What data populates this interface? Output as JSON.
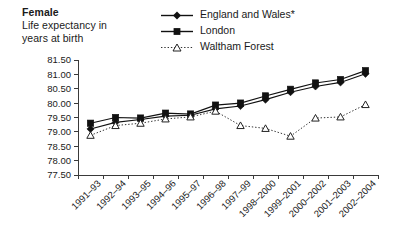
{
  "header": {
    "title": "Female",
    "subtitle_line1": "Life expectancy in",
    "subtitle_line2": "years at birth"
  },
  "legend": {
    "position": "top-right",
    "items": [
      {
        "label": "England and Wales*",
        "marker": "filled-diamond-icon",
        "line": "solid",
        "color": "#111111"
      },
      {
        "label": "London",
        "marker": "filled-square-icon",
        "line": "solid",
        "color": "#111111"
      },
      {
        "label": "Waltham Forest",
        "marker": "open-triangle-icon",
        "line": "dotted",
        "color": "#333333"
      }
    ]
  },
  "chart_data": {
    "type": "line",
    "title": "Female",
    "subtitle": "Life expectancy in years at birth",
    "xlabel": "",
    "ylabel": "",
    "ylim": [
      77.5,
      81.5
    ],
    "ytick_step": 0.5,
    "yticks": [
      "81.50",
      "81.00",
      "80.50",
      "80.00",
      "79.50",
      "79.00",
      "78.50",
      "78.00",
      "77.50"
    ],
    "ytick_values": [
      81.5,
      81.0,
      80.5,
      80.0,
      79.5,
      79.0,
      78.5,
      78.0,
      77.5
    ],
    "grid": false,
    "legend_position": "top-right",
    "categories": [
      "1991–93",
      "1992–94",
      "1993–95",
      "1994–96",
      "1995–97",
      "1996–98",
      "1997–99",
      "1998–2000",
      "1999–2001",
      "2000–2002",
      "2001–2003",
      "2002–2004"
    ],
    "series": [
      {
        "name": "England and Wales*",
        "marker": "filled-diamond",
        "line": "solid",
        "color": "#111111",
        "values": [
          79.1,
          79.33,
          79.43,
          79.55,
          79.58,
          79.8,
          79.9,
          80.12,
          80.38,
          80.58,
          80.72,
          81.02
        ]
      },
      {
        "name": "London",
        "marker": "filled-square",
        "line": "solid",
        "color": "#111111",
        "values": [
          79.3,
          79.5,
          79.48,
          79.65,
          79.62,
          79.93,
          80.0,
          80.25,
          80.48,
          80.7,
          80.82,
          81.13
        ]
      },
      {
        "name": "Waltham Forest",
        "marker": "open-triangle",
        "line": "dotted",
        "color": "#333333",
        "values": [
          78.88,
          79.22,
          79.3,
          79.45,
          79.52,
          79.72,
          79.22,
          79.12,
          78.85,
          79.48,
          79.52,
          79.95
        ]
      }
    ],
    "footnote_marker": "*"
  }
}
